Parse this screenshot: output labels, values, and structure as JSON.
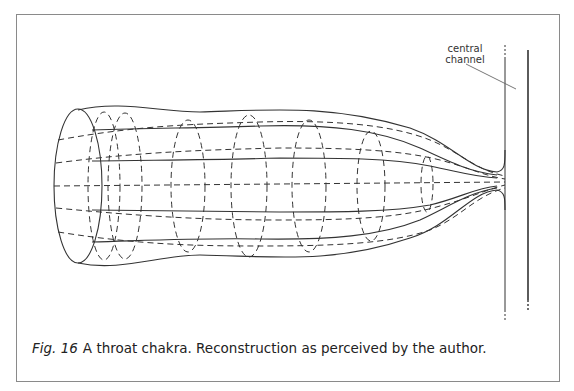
{
  "figure": {
    "label_central_channel_line1": "central",
    "label_central_channel_line2": "channel",
    "caption_number": "Fig. 16",
    "caption_text": "A throat chakra. Reconstruction as perceived by the author.",
    "stroke_color": "#333333",
    "frame_color": "#8a8a8a"
  }
}
